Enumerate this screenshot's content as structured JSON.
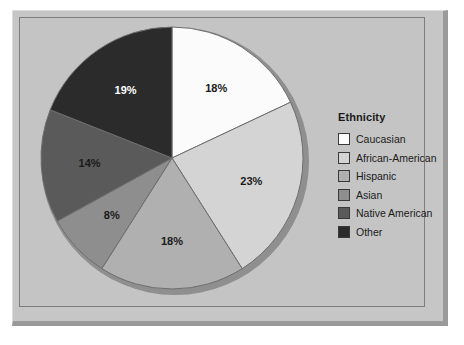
{
  "frame": {
    "panel_bg": "#c4c4c4",
    "frame_bg": "#c6c6c6",
    "shadow_color": "#9a9a9a",
    "border_color": "#7d7d7d"
  },
  "legend": {
    "title": "Ethnicity",
    "position": "right",
    "items": [
      {
        "label": "Caucasian",
        "color": "#fbfbfb"
      },
      {
        "label": "African-American",
        "color": "#d4d4d4"
      },
      {
        "label": "Hispanic",
        "color": "#b0b0b0"
      },
      {
        "label": "Asian",
        "color": "#8e8e8e"
      },
      {
        "label": "Native American",
        "color": "#5a5a5a"
      },
      {
        "label": "Other",
        "color": "#2b2b2b"
      }
    ]
  },
  "chart_data": {
    "type": "pie",
    "title": "",
    "legend_title": "Ethnicity",
    "legend_position": "right",
    "start_angle_deg": 0,
    "direction": "clockwise",
    "labels": [
      "Caucasian",
      "African-American",
      "Hispanic",
      "Asian",
      "Native American",
      "Other"
    ],
    "values": [
      18,
      23,
      18,
      8,
      14,
      19
    ],
    "value_labels": [
      "18%",
      "23%",
      "18%",
      "8%",
      "14%",
      "19%"
    ],
    "units": "percent",
    "total": 100,
    "colors": [
      "#fbfbfb",
      "#d4d4d4",
      "#b0b0b0",
      "#8e8e8e",
      "#5a5a5a",
      "#2b2b2b"
    ],
    "label_text_colors": [
      "#1a1a1a",
      "#1a1a1a",
      "#1a1a1a",
      "#1a1a1a",
      "#1a1a1a",
      "#ffffff"
    ],
    "slice_border_color": "#6e6e6e",
    "grid": false
  }
}
